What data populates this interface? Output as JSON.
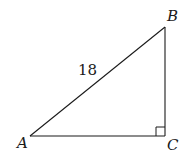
{
  "diagram": {
    "type": "right-triangle",
    "vertices": [
      {
        "name": "A",
        "x": 30,
        "y": 136
      },
      {
        "name": "B",
        "x": 165,
        "y": 27
      },
      {
        "name": "C",
        "x": 165,
        "y": 136
      }
    ],
    "labels": {
      "A": "A",
      "B": "B",
      "C": "C",
      "hypotenuse": "18"
    },
    "right_angle_at": "C",
    "stroke_color": "#1a1a1a"
  }
}
